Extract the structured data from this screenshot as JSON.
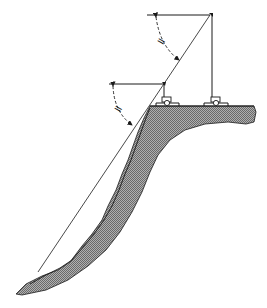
{
  "diagram": {
    "type": "slope-angle-measurement",
    "labels": {
      "upper_angle_mark": "=",
      "lower_angle_mark": "="
    },
    "colors": {
      "line": "#1a1a1a",
      "ground_fill": "#8a8a8a",
      "background": "#ffffff"
    },
    "instruments": [
      {
        "name": "lower-instrument",
        "x": 168,
        "y": 106
      },
      {
        "name": "upper-instrument",
        "x": 218,
        "y": 106
      }
    ]
  }
}
